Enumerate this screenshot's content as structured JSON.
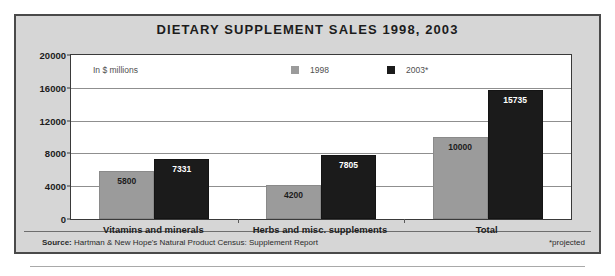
{
  "chart_data": {
    "type": "bar",
    "title": "DIETARY SUPPLEMENT SALES 1998, 2003",
    "units_note": "In $ millions",
    "xlabel": "",
    "ylabel": "",
    "ylim": [
      0,
      20000
    ],
    "ytick_labels": [
      "0",
      "4000",
      "8000",
      "12000",
      "16000",
      "20000"
    ],
    "ytick_values": [
      0,
      4000,
      8000,
      12000,
      16000,
      20000
    ],
    "grid": true,
    "legend_position": "top-center",
    "categories": [
      "Vitamins and minerals",
      "Herbs and misc. supplements",
      "Total"
    ],
    "series": [
      {
        "name": "1998",
        "color": "#9b9b9b",
        "values": [
          5800,
          4200,
          10000
        ],
        "labels": [
          "5800",
          "4200",
          "10000"
        ]
      },
      {
        "name": "2003*",
        "color": "#1b1b1b",
        "values": [
          7331,
          7805,
          15735
        ],
        "labels": [
          "7331",
          "7805",
          "15735"
        ]
      }
    ],
    "annotations": {
      "source_prefix": "Source:",
      "source_text": "Hartman & New Hope's Natural Product Census: Supplement Report",
      "footnote": "*projected"
    }
  },
  "colors": {
    "panel_background": "#d6d6d6",
    "panel_border": "#4a4a4a",
    "plot_background": "#ffffff",
    "plot_border": "#3a3a3a",
    "gridline": "#8f8f8f",
    "series_1998": "#9b9b9b",
    "series_2003": "#1b1b1b",
    "text": "#1c1c1c"
  }
}
